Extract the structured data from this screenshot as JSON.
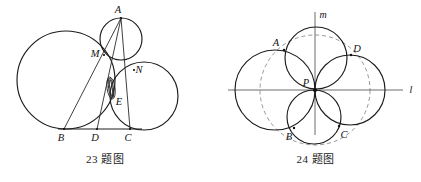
{
  "page": {
    "width": 421,
    "height": 182,
    "background": "#ffffff",
    "ink_color": "#1c1c1c",
    "axis_color": "#5c5c5c",
    "dashed_color": "#8a8a8a"
  },
  "figures": [
    {
      "id": "figure-23",
      "caption": "23 题图",
      "description": "Three tangent circles resting on base line BC with cevians from A",
      "baseline": {
        "label": "BC",
        "x1": 58,
        "y1": 129,
        "x2": 140,
        "y2": 129
      },
      "circles": [
        {
          "name": "large-left-circle",
          "cx": 66,
          "cy": 80,
          "r": 49
        },
        {
          "name": "small-top-circle",
          "cx": 121,
          "cy": 39,
          "r": 21
        },
        {
          "name": "right-circle",
          "cx": 144,
          "cy": 96,
          "r": 34
        }
      ],
      "points": [
        {
          "label": "A",
          "x": 121,
          "y": 18,
          "lx": 120,
          "ly": 13
        },
        {
          "label": "M",
          "x": 104,
          "y": 55,
          "lx": 95,
          "ly": 55
        },
        {
          "label": "N",
          "x": 134,
          "y": 70,
          "lx": 138,
          "ly": 70
        },
        {
          "label": "E",
          "x": 112,
          "y": 98,
          "lx": 117,
          "ly": 104
        },
        {
          "label": "B",
          "x": 64,
          "y": 129,
          "lx": 60,
          "ly": 140
        },
        {
          "label": "D",
          "x": 97,
          "y": 129,
          "lx": 94,
          "ly": 140
        },
        {
          "label": "C",
          "x": 130,
          "y": 129,
          "lx": 127,
          "ly": 140
        }
      ],
      "segments": [
        {
          "name": "segment-A-B",
          "x1": 121,
          "y1": 18,
          "x2": 64,
          "y2": 129
        },
        {
          "name": "segment-A-D",
          "x1": 121,
          "y1": 18,
          "x2": 97,
          "y2": 129
        },
        {
          "name": "segment-A-C",
          "x1": 121,
          "y1": 18,
          "x2": 130,
          "y2": 129
        }
      ],
      "lens": {
        "name": "vesica-lens",
        "cx": 111,
        "cy": 88,
        "rx": 4,
        "ry": 11,
        "rotate": -8
      }
    },
    {
      "id": "figure-24",
      "caption": "24 题图",
      "description": "Four circles through a common point P on perpendicular lines l and m, inscribed in a dashed circle",
      "lines": [
        {
          "name": "line-l",
          "label": "l",
          "x1": 18,
          "y1": 90,
          "x2": 193,
          "y2": 90,
          "lx": 200,
          "ly": 93
        },
        {
          "name": "line-m",
          "label": "m",
          "x1": 105,
          "y1": 12,
          "x2": 105,
          "y2": 135,
          "lx": 112,
          "ly": 18
        }
      ],
      "dashed_circle": {
        "name": "dashed-guide-circle",
        "cx": 105,
        "cy": 90,
        "r": 55
      },
      "circles": [
        {
          "name": "circle-left",
          "cx": 65,
          "cy": 90,
          "r": 40
        },
        {
          "name": "circle-top",
          "cx": 106,
          "cy": 58,
          "r": 31
        },
        {
          "name": "circle-right",
          "cx": 140,
          "cy": 90,
          "r": 35
        },
        {
          "name": "circle-bottom",
          "cx": 104,
          "cy": 117,
          "r": 27
        }
      ],
      "points": [
        {
          "label": "P",
          "x": 105,
          "y": 90,
          "lx": 96,
          "ly": 84
        },
        {
          "label": "A",
          "x": 74,
          "y": 50,
          "lx": 66,
          "ly": 44
        },
        {
          "label": "D",
          "x": 141,
          "y": 55,
          "lx": 146,
          "ly": 50
        },
        {
          "label": "B",
          "x": 84,
          "y": 128,
          "lx": 78,
          "ly": 139
        },
        {
          "label": "C",
          "x": 129,
          "y": 126,
          "lx": 133,
          "ly": 137
        }
      ]
    }
  ]
}
